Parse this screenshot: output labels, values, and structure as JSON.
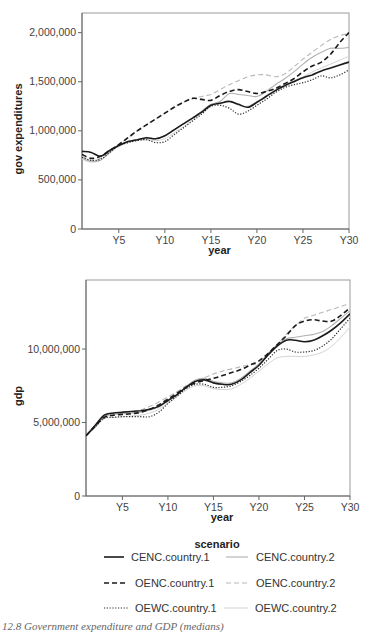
{
  "caption": "12.8 Government expenditure and GDP (medians)",
  "legend": {
    "title": "scenario",
    "entries": [
      {
        "name": "CENC.country.1",
        "color": "#1a1a1a",
        "dash": "",
        "width": 1.6
      },
      {
        "name": "CENC.country.2",
        "color": "#b0b0b0",
        "dash": "",
        "width": 1.1
      },
      {
        "name": "OENC.country.1",
        "color": "#1a1a1a",
        "dash": "5,3",
        "width": 1.6
      },
      {
        "name": "OENC.country.2",
        "color": "#b8b8b8",
        "dash": "5,3",
        "width": 1.1
      },
      {
        "name": "OEWC.country.1",
        "color": "#2a2a2a",
        "dash": "1.2,1.6",
        "width": 1.2
      },
      {
        "name": "OEWC.country.2",
        "color": "#d4d4d4",
        "dash": "",
        "width": 1.0
      }
    ]
  },
  "chart_data": [
    {
      "type": "line",
      "title": "",
      "xlabel": "year",
      "ylabel": "gov expenditures",
      "x": [
        1,
        2,
        3,
        4,
        5,
        6,
        7,
        8,
        9,
        10,
        11,
        12,
        13,
        14,
        15,
        16,
        17,
        18,
        19,
        20,
        21,
        22,
        23,
        24,
        25,
        26,
        27,
        28,
        29,
        30
      ],
      "xticks": [
        5,
        10,
        15,
        20,
        25,
        30
      ],
      "xtick_labels": [
        "Y5",
        "Y10",
        "Y15",
        "Y20",
        "Y25",
        "Y30"
      ],
      "ylim": [
        0,
        2200000
      ],
      "yticks": [
        0,
        500000,
        1000000,
        1500000,
        2000000
      ],
      "ytick_labels": [
        "0",
        "500,000",
        "1,000,000",
        "1,500,000",
        "2,000,000"
      ],
      "grid": false,
      "series": [
        {
          "name": "CENC.country.1",
          "values": [
            790000,
            780000,
            740000,
            800000,
            850000,
            890000,
            910000,
            930000,
            920000,
            950000,
            1010000,
            1070000,
            1130000,
            1190000,
            1260000,
            1280000,
            1300000,
            1270000,
            1240000,
            1290000,
            1350000,
            1410000,
            1460000,
            1500000,
            1540000,
            1570000,
            1610000,
            1640000,
            1670000,
            1700000
          ]
        },
        {
          "name": "CENC.country.2",
          "values": [
            720000,
            690000,
            700000,
            780000,
            850000,
            890000,
            910000,
            920000,
            920000,
            950000,
            1010000,
            1070000,
            1130000,
            1200000,
            1270000,
            1300000,
            1380000,
            1370000,
            1360000,
            1350000,
            1400000,
            1470000,
            1530000,
            1600000,
            1680000,
            1750000,
            1800000,
            1840000,
            1840000,
            1850000
          ]
        },
        {
          "name": "OENC.country.1",
          "values": [
            760000,
            720000,
            740000,
            800000,
            860000,
            930000,
            1000000,
            1060000,
            1120000,
            1180000,
            1240000,
            1290000,
            1330000,
            1320000,
            1310000,
            1360000,
            1400000,
            1420000,
            1400000,
            1380000,
            1400000,
            1430000,
            1480000,
            1530000,
            1600000,
            1660000,
            1700000,
            1780000,
            1900000,
            2000000
          ]
        },
        {
          "name": "OENC.country.2",
          "values": [
            740000,
            700000,
            720000,
            790000,
            860000,
            930000,
            1000000,
            1060000,
            1120000,
            1180000,
            1240000,
            1290000,
            1330000,
            1350000,
            1370000,
            1420000,
            1470000,
            1510000,
            1550000,
            1570000,
            1570000,
            1550000,
            1580000,
            1650000,
            1730000,
            1800000,
            1870000,
            1930000,
            1970000,
            1990000
          ]
        },
        {
          "name": "OEWC.country.1",
          "values": [
            730000,
            700000,
            710000,
            780000,
            850000,
            880000,
            900000,
            910000,
            880000,
            890000,
            960000,
            1030000,
            1100000,
            1170000,
            1250000,
            1260000,
            1230000,
            1170000,
            1200000,
            1260000,
            1320000,
            1390000,
            1440000,
            1470000,
            1490000,
            1520000,
            1560000,
            1540000,
            1570000,
            1620000
          ]
        },
        {
          "name": "OEWC.country.2",
          "values": [
            710000,
            680000,
            700000,
            770000,
            840000,
            880000,
            900000,
            910000,
            900000,
            920000,
            980000,
            1040000,
            1110000,
            1180000,
            1250000,
            1280000,
            1300000,
            1260000,
            1250000,
            1300000,
            1360000,
            1420000,
            1470000,
            1510000,
            1550000,
            1600000,
            1640000,
            1680000,
            1720000,
            1760000
          ]
        }
      ]
    },
    {
      "type": "line",
      "title": "",
      "xlabel": "year",
      "ylabel": "gdp",
      "x": [
        1,
        2,
        3,
        4,
        5,
        6,
        7,
        8,
        9,
        10,
        11,
        12,
        13,
        14,
        15,
        16,
        17,
        18,
        19,
        20,
        21,
        22,
        23,
        24,
        25,
        26,
        27,
        28,
        29,
        30
      ],
      "xticks": [
        5,
        10,
        15,
        20,
        25,
        30
      ],
      "xtick_labels": [
        "Y5",
        "Y10",
        "Y15",
        "Y20",
        "Y25",
        "Y30"
      ],
      "ylim": [
        0,
        14700000
      ],
      "yticks": [
        0,
        5000000,
        10000000
      ],
      "ytick_labels": [
        "0",
        "5,000,000",
        "10,000,000"
      ],
      "grid": false,
      "series": [
        {
          "name": "CENC.country.1",
          "values": [
            4100000,
            4800000,
            5500000,
            5650000,
            5700000,
            5750000,
            5800000,
            5900000,
            6100000,
            6500000,
            6900000,
            7400000,
            7800000,
            7900000,
            7700000,
            7600000,
            7600000,
            7900000,
            8400000,
            8900000,
            9600000,
            10200000,
            10600000,
            10600000,
            10500000,
            10600000,
            10900000,
            11300000,
            11800000,
            12400000
          ]
        },
        {
          "name": "CENC.country.2",
          "values": [
            4100000,
            4700000,
            5400000,
            5550000,
            5600000,
            5650000,
            5700000,
            5850000,
            6050000,
            6450000,
            6900000,
            7450000,
            7900000,
            8000000,
            7800000,
            7700000,
            7700000,
            8000000,
            8500000,
            9000000,
            9700000,
            10300000,
            10700000,
            10800000,
            10900000,
            11000000,
            11200000,
            11600000,
            12100000,
            12600000
          ]
        },
        {
          "name": "OENC.country.1",
          "values": [
            4100000,
            4750000,
            5350000,
            5500000,
            5550000,
            5600000,
            5700000,
            5900000,
            6200000,
            6600000,
            7000000,
            7400000,
            7700000,
            7850000,
            8000000,
            8200000,
            8400000,
            8600000,
            8900000,
            9200000,
            9700000,
            10300000,
            10900000,
            11600000,
            11900000,
            12000000,
            11900000,
            11900000,
            12300000,
            12800000
          ]
        },
        {
          "name": "OENC.country.2",
          "values": [
            4100000,
            4800000,
            5450000,
            5600000,
            5650000,
            5700000,
            5850000,
            6100000,
            6400000,
            6750000,
            7100000,
            7500000,
            7800000,
            8050000,
            8300000,
            8500000,
            8650000,
            8800000,
            8950000,
            9000000,
            9600000,
            10300000,
            11000000,
            11600000,
            12100000,
            12300000,
            12500000,
            12700000,
            12900000,
            13100000
          ]
        },
        {
          "name": "OEWC.country.1",
          "values": [
            4100000,
            4700000,
            5300000,
            5350000,
            5400000,
            5400000,
            5400000,
            5400000,
            5700000,
            6300000,
            6800000,
            7300000,
            7600000,
            7600000,
            7400000,
            7400000,
            7500000,
            7800000,
            8200000,
            8700000,
            9300000,
            9900000,
            10000000,
            9800000,
            9800000,
            9900000,
            10200000,
            10700000,
            11400000,
            12100000
          ]
        },
        {
          "name": "OEWC.country.2",
          "values": [
            4100000,
            4650000,
            5250000,
            5350000,
            5400000,
            5450000,
            5500000,
            5650000,
            5900000,
            6300000,
            6750000,
            7200000,
            7500000,
            7500000,
            7300000,
            7250000,
            7300000,
            7600000,
            8000000,
            8500000,
            9000000,
            9400000,
            9500000,
            9500000,
            9500000,
            9600000,
            9800000,
            10200000,
            10800000,
            11500000
          ]
        }
      ]
    }
  ]
}
